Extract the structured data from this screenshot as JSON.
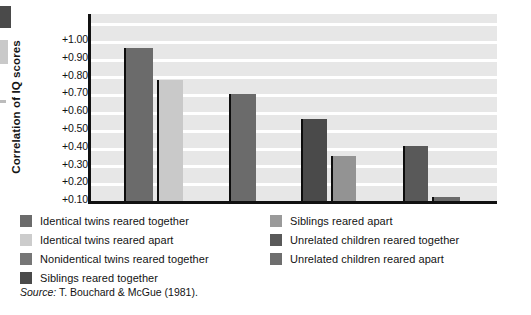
{
  "chart_data": {
    "type": "bar",
    "title": "",
    "xlabel": "",
    "ylabel": "Correlation of IQ scores",
    "ylim": [
      0,
      1.05
    ],
    "grid": true,
    "gridlines": [
      0.1,
      0.2,
      0.3,
      0.4,
      0.5,
      0.6,
      0.7,
      0.8,
      0.9,
      1.0
    ],
    "ytick_labels": [
      "+1.00",
      "+0.90",
      "+0.80",
      "+0.70",
      "+0.60",
      "+0.50",
      "+0.40",
      "+0.30",
      "+0.20",
      "+0.10"
    ],
    "ytick_values": [
      1.0,
      0.9,
      0.8,
      0.7,
      0.6,
      0.5,
      0.4,
      0.3,
      0.2,
      0.1
    ],
    "legend_position": "below",
    "categories": [
      "Identical twins reared together",
      "Identical twins reared apart",
      "Nonidentical twins reared together",
      "Siblings reared together",
      "Siblings reared apart",
      "Unrelated children reared together",
      "Unrelated children reared apart"
    ],
    "values": [
      0.86,
      0.68,
      0.6,
      0.46,
      0.25,
      0.31,
      0.02
    ],
    "colors": [
      "#6b6b6b",
      "#c9c9c9",
      "#6b6b6b",
      "#4a4a4a",
      "#939393",
      "#595959",
      "#6b6b6b"
    ],
    "bar_geometry": [
      {
        "left_pct": 8.1,
        "width_pct": 7.1
      },
      {
        "left_pct": 16.2,
        "width_pct": 6.4
      },
      {
        "left_pct": 34.0,
        "width_pct": 6.6
      },
      {
        "left_pct": 51.8,
        "width_pct": 6.4
      },
      {
        "left_pct": 59.2,
        "width_pct": 6.1
      },
      {
        "left_pct": 76.8,
        "width_pct": 6.1
      },
      {
        "left_pct": 83.9,
        "width_pct": 7.1
      }
    ]
  },
  "legend": {
    "left_items": [
      {
        "label": "Identical twins reared together",
        "color": "#6b6b6b"
      },
      {
        "label": "Identical twins reared apart",
        "color": "#cccccc"
      },
      {
        "label": "Nonidentical twins reared together",
        "color": "#767676"
      },
      {
        "label": "Siblings reared together",
        "color": "#4a4a4a"
      }
    ],
    "right_items": [
      {
        "label": "Siblings reared apart",
        "color": "#9a9a9a"
      },
      {
        "label": "Unrelated children reared together",
        "color": "#595959"
      },
      {
        "label": "Unrelated children reared apart",
        "color": "#6e6e6e"
      }
    ]
  },
  "source": {
    "prefix": "Source:",
    "text": "T. Bouchard & McGue (1981)."
  }
}
